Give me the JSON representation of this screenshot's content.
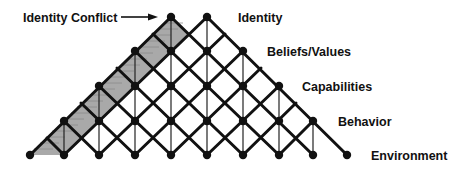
{
  "diagram": {
    "type": "neuro-logical-levels-lattice",
    "annotation": {
      "label": "Identity Conflict",
      "arrow": "right-arrow"
    },
    "levels": [
      {
        "label": "Identity"
      },
      {
        "label": "Beliefs/Values"
      },
      {
        "label": "Capabilities"
      },
      {
        "label": "Behavior"
      },
      {
        "label": "Environment"
      }
    ],
    "colors": {
      "line": "#111111",
      "node": "#111111",
      "shading": "#a9a9a9",
      "hatch": "#8a8a8a",
      "background": "#ffffff"
    },
    "grid": {
      "columns_x": [
        30,
        64,
        99,
        135,
        171,
        207,
        243,
        279,
        313,
        347
      ],
      "rows_y": [
        17,
        51,
        86,
        121,
        155
      ]
    }
  }
}
